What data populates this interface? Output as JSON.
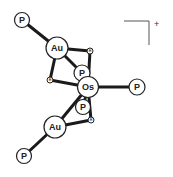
{
  "diagram": {
    "charge": "+",
    "atoms": [
      {
        "id": "P1",
        "label": "P",
        "x": 22,
        "y": 20,
        "r": 7.5
      },
      {
        "id": "Au1",
        "label": "Au",
        "x": 57,
        "y": 48,
        "r": 11
      },
      {
        "id": "H1",
        "label": "H",
        "x": 90,
        "y": 51,
        "r": 3
      },
      {
        "id": "P2",
        "label": "P",
        "x": 82,
        "y": 73,
        "r": 8
      },
      {
        "id": "H2",
        "label": "H",
        "x": 50,
        "y": 80,
        "r": 3
      },
      {
        "id": "Os",
        "label": "Os",
        "x": 88,
        "y": 87,
        "r": 10.5
      },
      {
        "id": "P3",
        "label": "P",
        "x": 137,
        "y": 87,
        "r": 8
      },
      {
        "id": "P4",
        "label": "P",
        "x": 83,
        "y": 107,
        "r": 7.5
      },
      {
        "id": "H3",
        "label": "H",
        "x": 91,
        "y": 120,
        "r": 3
      },
      {
        "id": "Au2",
        "label": "Au",
        "x": 55,
        "y": 127,
        "r": 11
      },
      {
        "id": "P5",
        "label": "P",
        "x": 24,
        "y": 156,
        "r": 7.5
      }
    ],
    "bonds": [
      [
        "P1",
        "Au1"
      ],
      [
        "Au1",
        "H1"
      ],
      [
        "Au1",
        "P2"
      ],
      [
        "Au1",
        "H2"
      ],
      [
        "H1",
        "Os"
      ],
      [
        "H2",
        "Os"
      ],
      [
        "P2",
        "Os"
      ],
      [
        "Os",
        "P3"
      ],
      [
        "Os",
        "P4"
      ],
      [
        "Os",
        "H3"
      ],
      [
        "Os",
        "Au2"
      ],
      [
        "Au2",
        "H3"
      ],
      [
        "Au2",
        "P5"
      ]
    ]
  }
}
